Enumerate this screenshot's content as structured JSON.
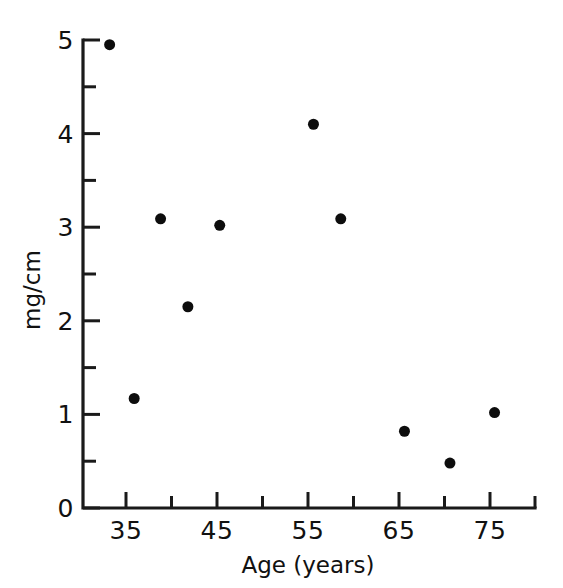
{
  "chart_data": {
    "type": "scatter",
    "title": "",
    "xlabel": "Age (years)",
    "ylabel": "mg/cm",
    "xlim": [
      30,
      80
    ],
    "ylim": [
      0,
      5.2
    ],
    "grid": false,
    "legend": null,
    "x_major_ticks": [
      35,
      45,
      55,
      65,
      75
    ],
    "x_minor_ticks": [
      40,
      50,
      60,
      70,
      80
    ],
    "x_tick_labels": [
      "35",
      "45",
      "55",
      "65",
      "75"
    ],
    "y_major_ticks": [
      0,
      1,
      2,
      3,
      4,
      5
    ],
    "y_minor_ticks": [
      0.5,
      1.5,
      2.5,
      3.5,
      4.5
    ],
    "y_tick_labels": [
      "0",
      "1",
      "2",
      "3",
      "4",
      "5"
    ],
    "marker": "filled-circle",
    "marker_color": "#0d0d0d",
    "marker_size": 11,
    "points": [
      {
        "x": 33.2,
        "y": 4.95
      },
      {
        "x": 35.9,
        "y": 1.17
      },
      {
        "x": 38.8,
        "y": 3.09
      },
      {
        "x": 41.8,
        "y": 2.15
      },
      {
        "x": 45.3,
        "y": 3.02
      },
      {
        "x": 55.6,
        "y": 4.1
      },
      {
        "x": 58.6,
        "y": 3.09
      },
      {
        "x": 65.6,
        "y": 0.82
      },
      {
        "x": 70.6,
        "y": 0.48
      },
      {
        "x": 75.5,
        "y": 1.02
      }
    ],
    "series": [
      {
        "name": "observations",
        "x": [
          33.2,
          35.9,
          38.8,
          41.8,
          45.3,
          55.6,
          58.6,
          65.6,
          70.6,
          75.5
        ],
        "y": [
          4.95,
          1.17,
          3.09,
          2.15,
          3.02,
          4.1,
          3.09,
          0.82,
          0.48,
          1.02
        ]
      }
    ]
  },
  "axes": {
    "x_axis_title": "Age (years)",
    "y_axis_title": "mg/cm"
  },
  "colors": {
    "axis": "#1a1a1a",
    "marker": "#0d0d0d",
    "background": "#ffffff"
  }
}
